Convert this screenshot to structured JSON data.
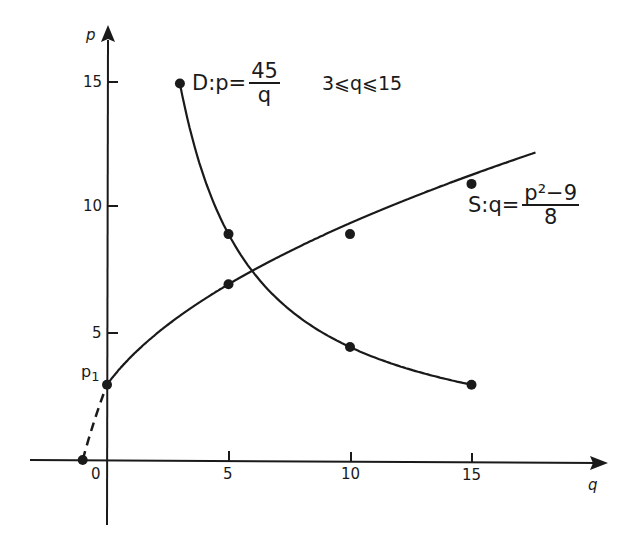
{
  "chart_data": {
    "type": "line",
    "title": "",
    "xlabel": "q",
    "ylabel": "p",
    "xlim": [
      -3,
      18
    ],
    "ylim": [
      -3,
      17
    ],
    "grid": false,
    "legend": "inline annotations",
    "x_ticks": [
      0,
      5,
      10,
      15
    ],
    "y_ticks": [
      5,
      10,
      15
    ],
    "series": [
      {
        "name": "D: p = 45/q",
        "domain": "3 ≤ q ≤ 15",
        "points": [
          [
            3,
            15
          ],
          [
            5,
            9
          ],
          [
            10,
            4.5
          ],
          [
            15,
            3
          ]
        ]
      },
      {
        "name": "S: q = (p^2 - 9)/8",
        "points": [
          [
            -1,
            0
          ],
          [
            0,
            3
          ],
          [
            5,
            7
          ],
          [
            10,
            9
          ],
          [
            15,
            11
          ]
        ],
        "dashed_segment": [
          [
            -1,
            0
          ],
          [
            0,
            3
          ]
        ]
      }
    ],
    "annotations": [
      "D:p=45/q",
      "3≤q≤15",
      "S:q=(p²−9)/8",
      "p₁"
    ]
  },
  "axes": {
    "x_label": "q",
    "y_label": "p",
    "x_ticks": [
      "0",
      "5",
      "10",
      "15"
    ],
    "y_ticks": [
      "5",
      "10",
      "15"
    ]
  },
  "labels": {
    "demand_prefix": "D:p=",
    "demand_num": "45",
    "demand_den": "q",
    "condition": "3⩽q⩽15",
    "supply_prefix": "S:q=",
    "supply_num": "p²−9",
    "supply_den": "8",
    "p1_main": "p",
    "p1_sub": "1"
  },
  "colors": {
    "ink": "#1a1a1a",
    "background": "#ffffff"
  }
}
